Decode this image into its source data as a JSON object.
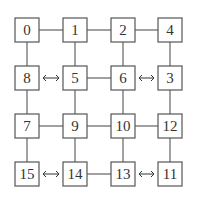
{
  "diagram": {
    "type": "grid-network",
    "grid": {
      "rows": 4,
      "cols": 4,
      "box_size": 24,
      "col_x": [
        15,
        63,
        111,
        158
      ],
      "row_y": [
        18,
        66,
        114,
        162
      ]
    },
    "nodes": [
      {
        "id": "0",
        "row": 0,
        "col": 0
      },
      {
        "id": "1",
        "row": 0,
        "col": 1
      },
      {
        "id": "2",
        "row": 0,
        "col": 2
      },
      {
        "id": "4",
        "row": 0,
        "col": 3
      },
      {
        "id": "8",
        "row": 1,
        "col": 0
      },
      {
        "id": "5",
        "row": 1,
        "col": 1
      },
      {
        "id": "6",
        "row": 1,
        "col": 2
      },
      {
        "id": "3",
        "row": 1,
        "col": 3
      },
      {
        "id": "7",
        "row": 2,
        "col": 0
      },
      {
        "id": "9",
        "row": 2,
        "col": 1
      },
      {
        "id": "10",
        "row": 2,
        "col": 2
      },
      {
        "id": "12",
        "row": 2,
        "col": 3
      },
      {
        "id": "15",
        "row": 3,
        "col": 0
      },
      {
        "id": "14",
        "row": 3,
        "col": 1
      },
      {
        "id": "13",
        "row": 3,
        "col": 2
      },
      {
        "id": "11",
        "row": 3,
        "col": 3
      }
    ],
    "edges": [
      {
        "from": "0",
        "to": "1",
        "kind": "line"
      },
      {
        "from": "1",
        "to": "2",
        "kind": "line"
      },
      {
        "from": "2",
        "to": "4",
        "kind": "line"
      },
      {
        "from": "8",
        "to": "5",
        "kind": "double-arrow"
      },
      {
        "from": "5",
        "to": "6",
        "kind": "line"
      },
      {
        "from": "6",
        "to": "3",
        "kind": "double-arrow"
      },
      {
        "from": "7",
        "to": "9",
        "kind": "line"
      },
      {
        "from": "9",
        "to": "10",
        "kind": "line"
      },
      {
        "from": "10",
        "to": "12",
        "kind": "line"
      },
      {
        "from": "15",
        "to": "14",
        "kind": "double-arrow"
      },
      {
        "from": "14",
        "to": "13",
        "kind": "line"
      },
      {
        "from": "13",
        "to": "11",
        "kind": "double-arrow"
      },
      {
        "from": "0",
        "to": "8",
        "kind": "line"
      },
      {
        "from": "8",
        "to": "7",
        "kind": "line"
      },
      {
        "from": "7",
        "to": "15",
        "kind": "line"
      },
      {
        "from": "1",
        "to": "5",
        "kind": "line"
      },
      {
        "from": "5",
        "to": "9",
        "kind": "line"
      },
      {
        "from": "9",
        "to": "14",
        "kind": "line"
      },
      {
        "from": "2",
        "to": "6",
        "kind": "line"
      },
      {
        "from": "6",
        "to": "10",
        "kind": "line"
      },
      {
        "from": "10",
        "to": "13",
        "kind": "line"
      },
      {
        "from": "4",
        "to": "3",
        "kind": "line"
      },
      {
        "from": "3",
        "to": "12",
        "kind": "line"
      },
      {
        "from": "12",
        "to": "11",
        "kind": "line"
      }
    ],
    "colors": {
      "box_stroke": "#555555",
      "edge": "#555555",
      "text": "#333333",
      "background": "#ffffff"
    }
  }
}
